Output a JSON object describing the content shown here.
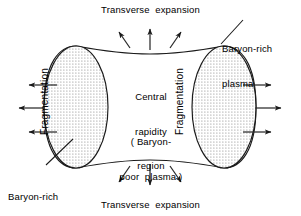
{
  "figure": {
    "background_color": "#ffffff",
    "line_color": "#1a1a1a",
    "stipple_color": "#6e6e6e",
    "labels": {
      "top_expansion": "Transverse  expansion",
      "bottom_expansion": "Transverse  expansion",
      "baryon_rich_right_line1": "Baryon-rich",
      "baryon_rich_right_line2": "plasma",
      "baryon_rich_left_line1": "Baryon-rich",
      "baryon_rich_left_line2": "plasma",
      "central_line1": "Central",
      "central_line2": "rapidity",
      "central_line3": "region",
      "paren_line1": "( Baryon-",
      "paren_line2": "poor  plasma )",
      "fragmentation_left": "Fragmentation",
      "fragmentation_right": "Fragmentation"
    },
    "arrows": {
      "top_count": 3,
      "bottom_count": 3,
      "left_count": 3,
      "right_count": 3,
      "top_directions": [
        "up-left",
        "up",
        "up-right"
      ],
      "bottom_directions": [
        "down-left",
        "down",
        "down-right"
      ],
      "left_direction": "left",
      "right_direction": "right"
    },
    "regions": {
      "left_blob_label": "fragmentation-region-left",
      "right_blob_label": "fragmentation-region-right",
      "center_label": "central-rapidity-region"
    }
  }
}
